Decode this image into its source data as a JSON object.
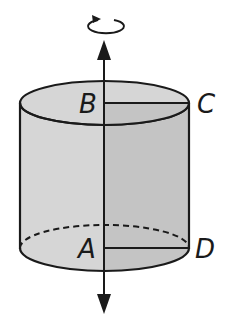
{
  "figure": {
    "type": "cylinder-of-revolution",
    "labels": {
      "top_center": "B",
      "top_edge": "C",
      "bottom_center": "A",
      "bottom_edge": "D"
    },
    "icons": {
      "rotation": "rotation-arrow-icon",
      "axis_up": "arrow-up-icon",
      "axis_down": "arrow-down-icon"
    },
    "colors": {
      "stroke": "#1a1a1a",
      "fill_light": "#d6d6d6",
      "fill_dark": "#c4c4c4",
      "background": "#ffffff"
    }
  }
}
